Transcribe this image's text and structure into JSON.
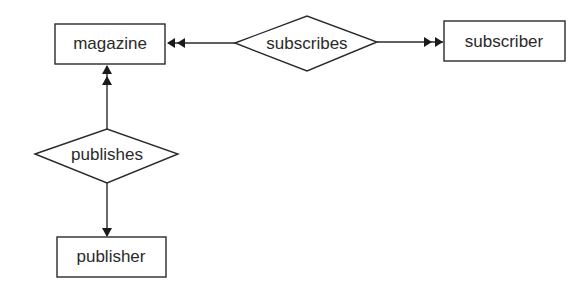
{
  "diagram": {
    "type": "entity-relationship",
    "entities": [
      {
        "id": "magazine",
        "label": "magazine"
      },
      {
        "id": "subscriber",
        "label": "subscriber"
      },
      {
        "id": "publisher",
        "label": "publisher"
      }
    ],
    "relationships": [
      {
        "id": "subscribes",
        "label": "subscribes"
      },
      {
        "id": "publishes",
        "label": "publishes"
      }
    ],
    "connections": [
      {
        "from": "subscribes",
        "to": "magazine",
        "arrow": "double-head"
      },
      {
        "from": "subscribes",
        "to": "subscriber",
        "arrow": "double-head"
      },
      {
        "from": "publishes",
        "to": "magazine",
        "arrow": "double-head"
      },
      {
        "from": "publishes",
        "to": "publisher",
        "arrow": "single-head"
      }
    ]
  }
}
